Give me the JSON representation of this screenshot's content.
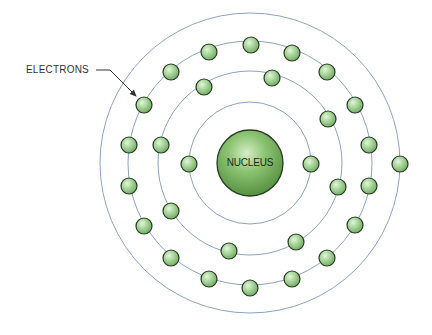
{
  "diagram": {
    "type": "atomic_structure",
    "labels": {
      "electrons": "ELECTRONS",
      "nucleus": "NUCLEUS"
    },
    "center": [
      250,
      163
    ],
    "nucleus_radius": 33,
    "colors": {
      "shell": "#8aa3c4",
      "electron_fill": "#9dcf8e",
      "electron_stroke": "#2b3a26",
      "nucleus_fill": "#6aa552",
      "nucleus_stroke": "#2b3a26",
      "label": "#333333",
      "arrow": "#333333"
    },
    "shells": [
      {
        "name": "shell-1",
        "radius": 61,
        "electron_count": 2
      },
      {
        "name": "shell-2",
        "radius": 92,
        "electron_count": 8
      },
      {
        "name": "shell-3",
        "radius": 122,
        "electron_count": 18
      },
      {
        "name": "shell-4",
        "radius": 150,
        "electron_count": 1
      }
    ],
    "electrons": [
      {
        "shell": 1,
        "x": 189,
        "y": 164
      },
      {
        "shell": 1,
        "x": 311,
        "y": 164
      },
      {
        "shell": 2,
        "x": 204,
        "y": 87
      },
      {
        "shell": 2,
        "x": 272,
        "y": 78
      },
      {
        "shell": 2,
        "x": 328,
        "y": 119
      },
      {
        "shell": 2,
        "x": 338,
        "y": 187
      },
      {
        "shell": 2,
        "x": 296,
        "y": 242
      },
      {
        "shell": 2,
        "x": 229,
        "y": 251
      },
      {
        "shell": 2,
        "x": 171,
        "y": 211
      },
      {
        "shell": 2,
        "x": 161,
        "y": 145
      },
      {
        "shell": 3,
        "x": 209,
        "y": 52
      },
      {
        "shell": 3,
        "x": 251,
        "y": 45
      },
      {
        "shell": 3,
        "x": 292,
        "y": 53
      },
      {
        "shell": 3,
        "x": 327,
        "y": 72
      },
      {
        "shell": 3,
        "x": 355,
        "y": 105
      },
      {
        "shell": 3,
        "x": 369,
        "y": 145
      },
      {
        "shell": 3,
        "x": 369,
        "y": 186
      },
      {
        "shell": 3,
        "x": 355,
        "y": 225
      },
      {
        "shell": 3,
        "x": 327,
        "y": 258
      },
      {
        "shell": 3,
        "x": 292,
        "y": 279
      },
      {
        "shell": 3,
        "x": 250,
        "y": 288
      },
      {
        "shell": 3,
        "x": 209,
        "y": 279
      },
      {
        "shell": 3,
        "x": 171,
        "y": 258
      },
      {
        "shell": 3,
        "x": 144,
        "y": 226
      },
      {
        "shell": 3,
        "x": 129,
        "y": 186
      },
      {
        "shell": 3,
        "x": 129,
        "y": 145
      },
      {
        "shell": 3,
        "x": 144,
        "y": 105
      },
      {
        "shell": 3,
        "x": 171,
        "y": 72
      },
      {
        "shell": 4,
        "x": 400,
        "y": 164
      }
    ],
    "electron_radius": 8,
    "annotation": {
      "text_pos": [
        26,
        75
      ],
      "arrow_from": [
        96,
        70
      ],
      "arrow_mid": [
        110,
        70
      ],
      "arrow_to": [
        136,
        96
      ]
    }
  }
}
